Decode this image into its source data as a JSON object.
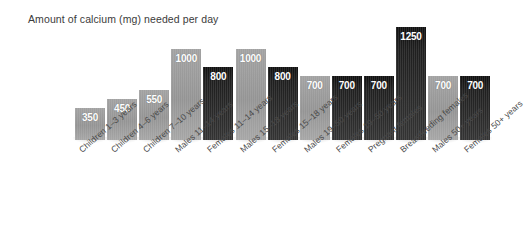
{
  "chart_data": {
    "type": "bar",
    "title": "Amount of calcium (mg) needed per day",
    "xlabel": "",
    "ylabel": "",
    "ylim": [
      0,
      1300
    ],
    "grid": false,
    "legend": "none",
    "orientation": "vertical",
    "value_labels": true,
    "categories": [
      "Children 1–3 years",
      "Children 4–6 years",
      "Children 7–10 years",
      "Males 11–14 years",
      "Females 11–14 years",
      "Males 15–18 years",
      "Females 15–18 years",
      "Males 19–50 years",
      "Females 19–50 years",
      "Pregnant females",
      "Breastfeeding females",
      "Males 50+ years",
      "Females 50+ years"
    ],
    "values": [
      350,
      450,
      550,
      1000,
      800,
      1000,
      800,
      700,
      700,
      700,
      1250,
      700,
      700
    ],
    "value_text": [
      "350",
      "450",
      "550",
      "1000",
      "800",
      "1000",
      "800",
      "700",
      "700",
      "700",
      "1250",
      "700",
      "700"
    ],
    "bar_shades": [
      "light",
      "light",
      "light",
      "light",
      "dark",
      "light",
      "dark",
      "light",
      "dark",
      "dark",
      "dark",
      "light",
      "dark"
    ],
    "colors": {
      "light_bar": "#9c9c9c",
      "dark_bar": "#242424",
      "background": "#ffffff",
      "title_text": "#3b3b3b",
      "label_text": "#4a4a4a",
      "value_text": "#ffffff"
    }
  }
}
